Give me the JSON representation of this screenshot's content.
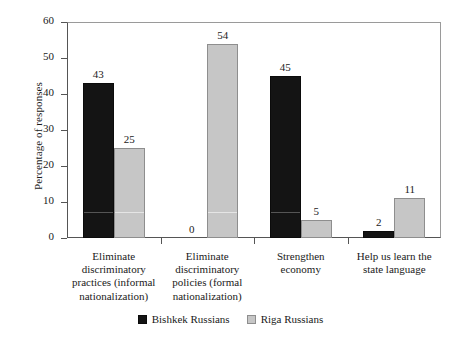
{
  "chart_data": {
    "type": "bar",
    "title": "",
    "subtitle": "",
    "xlabel": "",
    "ylabel": "Percentage of responses",
    "ylim": [
      0,
      60
    ],
    "yticks": [
      0,
      10,
      20,
      30,
      40,
      50,
      60
    ],
    "ytick_labels": [
      "0",
      "10",
      "20",
      "30",
      "40",
      "50",
      "60"
    ],
    "grid": false,
    "legend_position": "bottom",
    "categories": [
      "Eliminate\ndiscriminatory\npractices (informal\nnationalization)",
      "Eliminate\ndiscriminatory\npolicies (formal\nnationalization)",
      "Strengthen\neconomy",
      "Help us learn the\nstate language"
    ],
    "series": [
      {
        "name": "Bishkek Russians",
        "color": "#141414",
        "values": [
          43,
          0,
          45,
          2
        ],
        "value_labels": [
          "43",
          "0",
          "45",
          "2"
        ]
      },
      {
        "name": "Riga Russians",
        "color": "#c6c6c6",
        "values": [
          25,
          54,
          5,
          11
        ],
        "value_labels": [
          "25",
          "54",
          "5",
          "11"
        ]
      }
    ]
  },
  "axis": {
    "y_title": "Percentage of responses"
  },
  "legend": {
    "entries": [
      {
        "label": "Bishkek Russians",
        "swatch": "dark"
      },
      {
        "label": "Riga Russians",
        "swatch": "light"
      }
    ]
  }
}
